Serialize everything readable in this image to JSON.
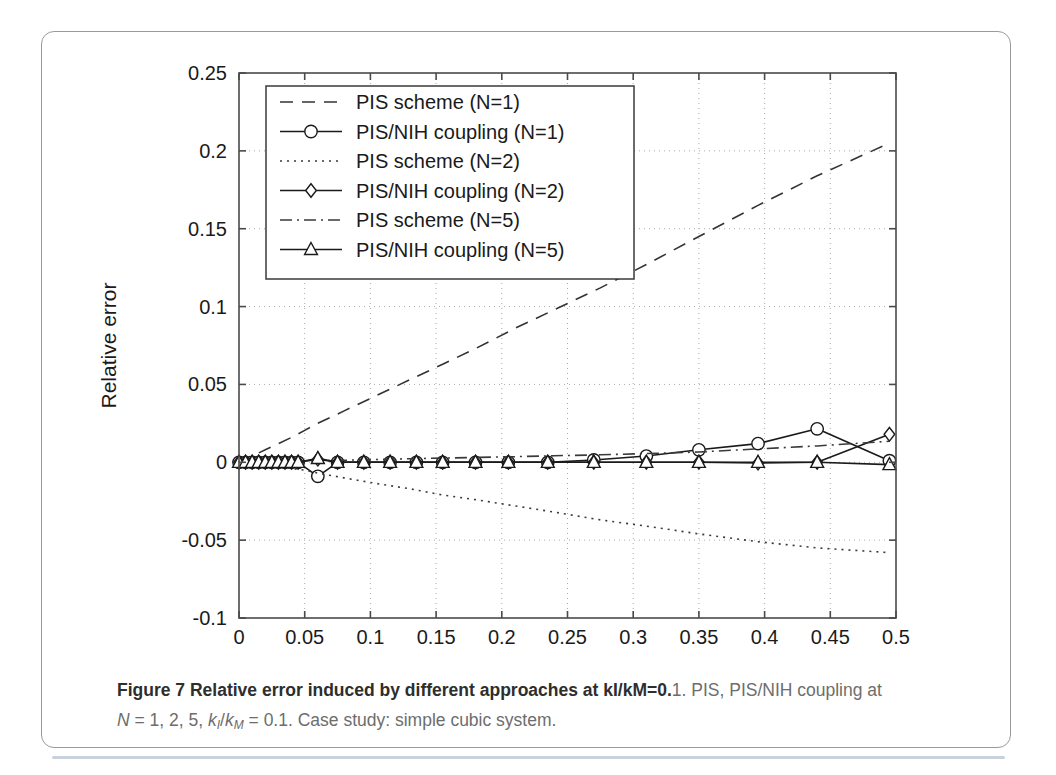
{
  "figure": {
    "caption_bold": "Figure 7 Relative error induced by different approaches at kI/kM=0.",
    "caption_rest": "1. PIS, PIS/NIH coupling at",
    "caption_line2_prefix": "N",
    "caption_line2_a": " = 1, 2, 5, ",
    "caption_line2_k1": "k",
    "caption_line2_k1sub": "I",
    "caption_line2_slash": "/",
    "caption_line2_k2": "k",
    "caption_line2_k2sub": "M",
    "caption_line2_b": " = 0.1. Case study: simple cubic system."
  },
  "chart_data": {
    "type": "line",
    "title": "",
    "xlabel": "Volume fraction f",
    "ylabel": "Relative error",
    "xlim": [
      0,
      0.5
    ],
    "ylim": [
      -0.1,
      0.25
    ],
    "grid": true,
    "xticks": [
      0,
      0.05,
      0.1,
      0.15,
      0.2,
      0.25,
      0.3,
      0.35,
      0.4,
      0.45,
      0.5
    ],
    "xticklabels": [
      "0",
      "0.05",
      "0.1",
      "0.15",
      "0.2",
      "0.25",
      "0.3",
      "0.35",
      "0.4",
      "0.45",
      "0.5"
    ],
    "yticks": [
      -0.1,
      -0.05,
      0,
      0.05,
      0.1,
      0.15,
      0.2,
      0.25
    ],
    "yticklabels": [
      "-0.1",
      "-0.05",
      "0",
      "0.05",
      "0.1",
      "0.15",
      "0.2",
      "0.25"
    ],
    "legend_position": "upper-left",
    "series": [
      {
        "name": "PIS scheme (N=1)",
        "style": "dashed",
        "marker": "none",
        "color": "#333333",
        "x": [
          0,
          0.01,
          0.02,
          0.03,
          0.04,
          0.05,
          0.06,
          0.08,
          0.1,
          0.13,
          0.155,
          0.18,
          0.21,
          0.24,
          0.275,
          0.31,
          0.35,
          0.395,
          0.44,
          0.495
        ],
        "y": [
          0.0,
          0.004,
          0.008,
          0.012,
          0.016,
          0.0205,
          0.025,
          0.033,
          0.041,
          0.053,
          0.063,
          0.073,
          0.086,
          0.098,
          0.112,
          0.127,
          0.145,
          0.165,
          0.184,
          0.205
        ]
      },
      {
        "name": "PIS/NIH coupling (N=1)",
        "style": "solid",
        "marker": "circle",
        "color": "#1a1a1a",
        "x": [
          0,
          0.005,
          0.01,
          0.015,
          0.02,
          0.025,
          0.03,
          0.035,
          0.04,
          0.045,
          0.06,
          0.075,
          0.095,
          0.115,
          0.135,
          0.155,
          0.18,
          0.205,
          0.235,
          0.27,
          0.31,
          0.35,
          0.395,
          0.44,
          0.495
        ],
        "y": [
          0.0,
          0.0,
          0.0,
          0.0,
          0.0,
          0.0,
          0.0,
          0.0,
          0.0,
          0.0,
          -0.009,
          0.0,
          0.0,
          0.0,
          0.0,
          0.0,
          0.0,
          0.0,
          0.0,
          0.0015,
          0.004,
          0.008,
          0.012,
          0.0215,
          0.001
        ]
      },
      {
        "name": "PIS scheme (N=2)",
        "style": "dotted",
        "marker": "none",
        "color": "#3a3a3a",
        "x": [
          0,
          0.01,
          0.02,
          0.03,
          0.04,
          0.05,
          0.06,
          0.08,
          0.1,
          0.13,
          0.155,
          0.18,
          0.21,
          0.24,
          0.275,
          0.31,
          0.35,
          0.395,
          0.44,
          0.495
        ],
        "y": [
          0.0,
          -0.001,
          -0.002,
          -0.003,
          -0.004,
          -0.005,
          -0.007,
          -0.01,
          -0.013,
          -0.017,
          -0.021,
          -0.024,
          -0.028,
          -0.032,
          -0.037,
          -0.041,
          -0.046,
          -0.051,
          -0.055,
          -0.058
        ]
      },
      {
        "name": "PIS/NIH coupling (N=2)",
        "style": "solid",
        "marker": "diamond",
        "color": "#1a1a1a",
        "x": [
          0,
          0.005,
          0.01,
          0.015,
          0.02,
          0.025,
          0.03,
          0.035,
          0.04,
          0.045,
          0.06,
          0.075,
          0.095,
          0.115,
          0.135,
          0.155,
          0.18,
          0.205,
          0.235,
          0.27,
          0.31,
          0.35,
          0.395,
          0.44,
          0.495
        ],
        "y": [
          0.0,
          0.0,
          0.0,
          0.0,
          0.0,
          0.0,
          0.0,
          0.0,
          0.0,
          0.0,
          0.002,
          0.0,
          0.0,
          0.0,
          0.0,
          0.0,
          0.0,
          0.0,
          0.0,
          0.0,
          0.0,
          0.0,
          -0.0005,
          0.0,
          0.018
        ]
      },
      {
        "name": "PIS scheme (N=5)",
        "style": "dashdot",
        "marker": "none",
        "color": "#3a3a3a",
        "x": [
          0,
          0.02,
          0.04,
          0.06,
          0.08,
          0.1,
          0.13,
          0.155,
          0.18,
          0.21,
          0.24,
          0.275,
          0.31,
          0.35,
          0.395,
          0.44,
          0.495
        ],
        "y": [
          0.0,
          0.0002,
          0.0005,
          0.001,
          0.0013,
          0.0017,
          0.0023,
          0.0027,
          0.0031,
          0.0036,
          0.0042,
          0.0048,
          0.0056,
          0.0066,
          0.0086,
          0.0105,
          0.0135
        ]
      },
      {
        "name": "PIS/NIH coupling (N=5)",
        "style": "solid",
        "marker": "triangle",
        "color": "#1a1a1a",
        "x": [
          0,
          0.005,
          0.01,
          0.015,
          0.02,
          0.025,
          0.03,
          0.035,
          0.04,
          0.045,
          0.06,
          0.075,
          0.095,
          0.115,
          0.135,
          0.155,
          0.18,
          0.205,
          0.235,
          0.27,
          0.31,
          0.35,
          0.395,
          0.44,
          0.495
        ],
        "y": [
          0.0,
          0.0,
          0.0,
          0.0,
          0.0,
          0.0,
          0.0,
          0.0,
          0.0,
          0.0,
          0.0025,
          0.0,
          0.0,
          0.0,
          0.0,
          0.0,
          0.0,
          0.0,
          0.0,
          0.0,
          0.0,
          0.0,
          0.0,
          0.0,
          -0.0015
        ]
      }
    ]
  }
}
